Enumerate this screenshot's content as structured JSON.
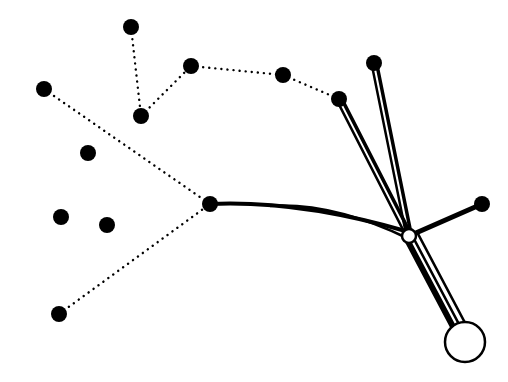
{
  "diagram": {
    "type": "network-graph",
    "background": "#ffffff",
    "ink": "#000000",
    "nodes": [
      {
        "id": "n1",
        "x": 131,
        "y": 27,
        "r": 8,
        "fill": "#000000"
      },
      {
        "id": "n2",
        "x": 191,
        "y": 66,
        "r": 8,
        "fill": "#000000"
      },
      {
        "id": "n3",
        "x": 141,
        "y": 116,
        "r": 8,
        "fill": "#000000"
      },
      {
        "id": "n4",
        "x": 44,
        "y": 89,
        "r": 8,
        "fill": "#000000"
      },
      {
        "id": "n5",
        "x": 88,
        "y": 153,
        "r": 8,
        "fill": "#000000"
      },
      {
        "id": "n6",
        "x": 61,
        "y": 217,
        "r": 8,
        "fill": "#000000"
      },
      {
        "id": "n7",
        "x": 107,
        "y": 225,
        "r": 8,
        "fill": "#000000"
      },
      {
        "id": "n8",
        "x": 59,
        "y": 314,
        "r": 8,
        "fill": "#000000"
      },
      {
        "id": "n9",
        "x": 210,
        "y": 204,
        "r": 8,
        "fill": "#000000"
      },
      {
        "id": "n10",
        "x": 283,
        "y": 75,
        "r": 8,
        "fill": "#000000"
      },
      {
        "id": "n11",
        "x": 339,
        "y": 99,
        "r": 8,
        "fill": "#000000"
      },
      {
        "id": "n12",
        "x": 374,
        "y": 63,
        "r": 8,
        "fill": "#000000"
      },
      {
        "id": "n13",
        "x": 482,
        "y": 204,
        "r": 8,
        "fill": "#000000"
      },
      {
        "id": "hub",
        "x": 409,
        "y": 236,
        "r": 7,
        "fill": "#ffffff"
      },
      {
        "id": "root",
        "x": 465,
        "y": 342,
        "r": 20,
        "fill": "#ffffff"
      }
    ],
    "dotted_edges": [
      {
        "from": "n1",
        "to": "n3"
      },
      {
        "from": "n3",
        "to": "n2"
      },
      {
        "from": "n2",
        "to": "n10"
      },
      {
        "from": "n10",
        "to": "n11"
      },
      {
        "from": "n4",
        "to": "n9"
      },
      {
        "from": "n8",
        "to": "n9"
      }
    ],
    "solid_edges": [
      {
        "from": "n9",
        "to": "hub",
        "style": "double-curve"
      },
      {
        "from": "n11",
        "to": "hub",
        "style": "double"
      },
      {
        "from": "n12",
        "to": "hub",
        "style": "double"
      },
      {
        "from": "n13",
        "to": "hub",
        "style": "thick"
      },
      {
        "from": "hub",
        "to": "root",
        "style": "triple"
      }
    ]
  }
}
